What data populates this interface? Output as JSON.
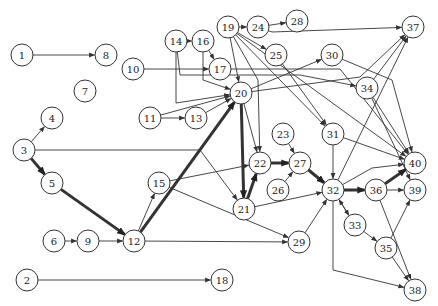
{
  "diagram": {
    "type": "directed-graph",
    "node_radius": 11,
    "colors": {
      "stroke": "#333333",
      "fill": "#ffffff",
      "text": "#222222"
    },
    "nodes": [
      {
        "id": "1",
        "x": 22,
        "y": 55
      },
      {
        "id": "8",
        "x": 106,
        "y": 55
      },
      {
        "id": "10",
        "x": 133,
        "y": 69
      },
      {
        "id": "7",
        "x": 85,
        "y": 91
      },
      {
        "id": "4",
        "x": 52,
        "y": 118
      },
      {
        "id": "3",
        "x": 24,
        "y": 150
      },
      {
        "id": "5",
        "x": 52,
        "y": 183
      },
      {
        "id": "6",
        "x": 54,
        "y": 241
      },
      {
        "id": "9",
        "x": 88,
        "y": 241
      },
      {
        "id": "12",
        "x": 134,
        "y": 241
      },
      {
        "id": "15",
        "x": 159,
        "y": 183
      },
      {
        "id": "2",
        "x": 27,
        "y": 280
      },
      {
        "id": "18",
        "x": 222,
        "y": 280
      },
      {
        "id": "14",
        "x": 176,
        "y": 41
      },
      {
        "id": "16",
        "x": 203,
        "y": 41
      },
      {
        "id": "17",
        "x": 220,
        "y": 69
      },
      {
        "id": "19",
        "x": 228,
        "y": 27
      },
      {
        "id": "24",
        "x": 258,
        "y": 27
      },
      {
        "id": "28",
        "x": 297,
        "y": 21
      },
      {
        "id": "20",
        "x": 241,
        "y": 93
      },
      {
        "id": "11",
        "x": 150,
        "y": 118
      },
      {
        "id": "13",
        "x": 196,
        "y": 118
      },
      {
        "id": "25",
        "x": 276,
        "y": 55
      },
      {
        "id": "30",
        "x": 332,
        "y": 55
      },
      {
        "id": "37",
        "x": 413,
        "y": 27
      },
      {
        "id": "34",
        "x": 367,
        "y": 88
      },
      {
        "id": "23",
        "x": 283,
        "y": 134
      },
      {
        "id": "22",
        "x": 260,
        "y": 163
      },
      {
        "id": "27",
        "x": 300,
        "y": 163
      },
      {
        "id": "26",
        "x": 278,
        "y": 190
      },
      {
        "id": "21",
        "x": 244,
        "y": 209
      },
      {
        "id": "31",
        "x": 333,
        "y": 134
      },
      {
        "id": "32",
        "x": 333,
        "y": 190
      },
      {
        "id": "36",
        "x": 376,
        "y": 190
      },
      {
        "id": "40",
        "x": 415,
        "y": 163
      },
      {
        "id": "39",
        "x": 415,
        "y": 190
      },
      {
        "id": "33",
        "x": 355,
        "y": 225
      },
      {
        "id": "35",
        "x": 386,
        "y": 248
      },
      {
        "id": "29",
        "x": 299,
        "y": 242
      },
      {
        "id": "38",
        "x": 415,
        "y": 290
      }
    ],
    "edges": [
      {
        "from": "1",
        "to": "8",
        "w": 1
      },
      {
        "from": "3",
        "to": "4",
        "w": 1
      },
      {
        "from": "3",
        "to": "5",
        "w": 3
      },
      {
        "from": "3",
        "to": "21",
        "w": 1,
        "via": [
          [
            200,
            150
          ]
        ]
      },
      {
        "from": "5",
        "to": "12",
        "w": 3
      },
      {
        "from": "6",
        "to": "9",
        "w": 1
      },
      {
        "from": "9",
        "to": "12",
        "w": 1
      },
      {
        "from": "12",
        "to": "15",
        "w": 1
      },
      {
        "from": "12",
        "to": "20",
        "w": 3
      },
      {
        "from": "12",
        "to": "29",
        "w": 1
      },
      {
        "from": "2",
        "to": "18",
        "w": 1
      },
      {
        "from": "10",
        "to": "17",
        "w": 1
      },
      {
        "from": "14",
        "to": "16",
        "w": 1
      },
      {
        "from": "14",
        "to": "20",
        "w": 1,
        "via": [
          [
            176,
            103
          ]
        ]
      },
      {
        "from": "14",
        "to": "34",
        "w": 1,
        "via": [
          [
            180,
            75
          ],
          [
            300,
            75
          ]
        ]
      },
      {
        "from": "16",
        "to": "17",
        "w": 1
      },
      {
        "from": "16",
        "to": "20",
        "w": 1,
        "via": [
          [
            203,
            80
          ]
        ]
      },
      {
        "from": "17",
        "to": "40",
        "w": 1,
        "via": [
          [
            340,
            69
          ]
        ]
      },
      {
        "from": "19",
        "to": "24",
        "w": 1
      },
      {
        "from": "19",
        "to": "25",
        "w": 1
      },
      {
        "from": "19",
        "to": "20",
        "w": 1
      },
      {
        "from": "19",
        "to": "31",
        "w": 1
      },
      {
        "from": "19",
        "to": "40",
        "w": 1
      },
      {
        "from": "19",
        "to": "22",
        "w": 1,
        "via": [
          [
            258,
            80
          ]
        ]
      },
      {
        "from": "24",
        "to": "28",
        "w": 1
      },
      {
        "from": "24",
        "to": "37",
        "w": 1,
        "via": [
          [
            272,
            32
          ]
        ]
      },
      {
        "from": "11",
        "to": "13",
        "w": 1
      },
      {
        "from": "11",
        "to": "20",
        "w": 1
      },
      {
        "from": "13",
        "to": "20",
        "w": 1
      },
      {
        "from": "20",
        "to": "30",
        "w": 1
      },
      {
        "from": "20",
        "to": "21",
        "w": 3
      },
      {
        "from": "20",
        "to": "22",
        "w": 1
      },
      {
        "from": "20",
        "to": "37",
        "w": 1,
        "via": [
          [
            360,
            77
          ]
        ]
      },
      {
        "from": "25",
        "to": "31",
        "w": 1
      },
      {
        "from": "30",
        "to": "40",
        "w": 1,
        "via": [
          [
            392,
            80
          ]
        ]
      },
      {
        "from": "34",
        "to": "37",
        "w": 1
      },
      {
        "from": "34",
        "to": "40",
        "w": 1
      },
      {
        "from": "34",
        "to": "39",
        "w": 1
      },
      {
        "from": "15",
        "to": "22",
        "w": 1
      },
      {
        "from": "15",
        "to": "29",
        "w": 1
      },
      {
        "from": "23",
        "to": "27",
        "w": 1
      },
      {
        "from": "22",
        "to": "27",
        "w": 3
      },
      {
        "from": "26",
        "to": "27",
        "w": 1
      },
      {
        "from": "21",
        "to": "22",
        "w": 3
      },
      {
        "from": "21",
        "to": "32",
        "w": 1
      },
      {
        "from": "27",
        "to": "32",
        "w": 3
      },
      {
        "from": "31",
        "to": "32",
        "w": 1
      },
      {
        "from": "31",
        "to": "40",
        "w": 1
      },
      {
        "from": "32",
        "to": "36",
        "w": 3
      },
      {
        "from": "32",
        "to": "37",
        "w": 1
      },
      {
        "from": "32",
        "to": "40",
        "w": 1,
        "via": [
          [
            372,
            168
          ]
        ]
      },
      {
        "from": "32",
        "to": "33",
        "w": 1
      },
      {
        "from": "33",
        "to": "32",
        "w": 1
      },
      {
        "from": "32",
        "to": "38",
        "w": 1,
        "via": [
          [
            333,
            270
          ]
        ]
      },
      {
        "from": "36",
        "to": "40",
        "w": 3
      },
      {
        "from": "36",
        "to": "39",
        "w": 1
      },
      {
        "from": "36",
        "to": "38",
        "w": 1
      },
      {
        "from": "33",
        "to": "35",
        "w": 1
      },
      {
        "from": "35",
        "to": "39",
        "w": 1
      },
      {
        "from": "35",
        "to": "38",
        "w": 1
      },
      {
        "from": "29",
        "to": "32",
        "w": 1
      }
    ]
  }
}
